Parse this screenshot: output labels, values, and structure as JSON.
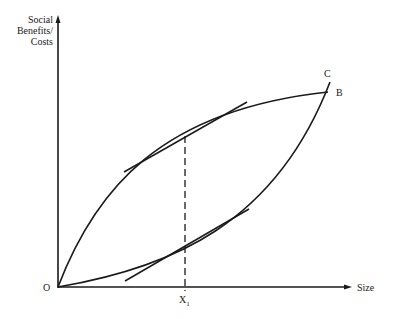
{
  "diagram": {
    "y_axis_label_lines": [
      "Social",
      "Benefits/",
      "Costs"
    ],
    "x_axis_label": "Size",
    "origin_label": "O",
    "curve_labels": {
      "concave": "B",
      "convex": "C"
    },
    "x_marker_label": "X",
    "x_marker_subscript": "1",
    "line_color": "#1a1a1a"
  }
}
